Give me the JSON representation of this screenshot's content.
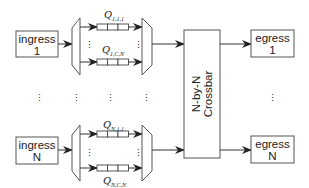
{
  "diagram": {
    "ingress": [
      {
        "line1": "ingress",
        "line2": "1"
      },
      {
        "line1": "ingress",
        "line2": "N"
      }
    ],
    "egress": [
      {
        "line1": "egress",
        "line2": "1"
      },
      {
        "line1": "egress",
        "line2": "N"
      }
    ],
    "crossbar": {
      "line1": "N-by-N",
      "line2": "Crossbar"
    },
    "queues": [
      {
        "symbol": "Q",
        "subscript": "1,1,1"
      },
      {
        "symbol": "Q",
        "subscript": "1,C,N"
      },
      {
        "symbol": "Q",
        "subscript": "N,1,1"
      },
      {
        "symbol": "Q",
        "subscript": "N,C,N"
      }
    ],
    "ellipsis": "⋮",
    "colors": {
      "stroke": "#333333",
      "background": "#ffffff"
    }
  }
}
